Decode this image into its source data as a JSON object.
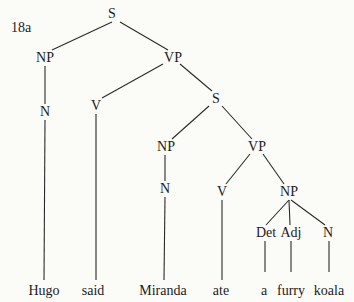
{
  "example_label": "18a",
  "tree": {
    "nodes": [
      {
        "id": "s1",
        "label": "S",
        "x": 112,
        "y": 14
      },
      {
        "id": "np1",
        "label": "NP",
        "x": 45,
        "y": 58
      },
      {
        "id": "vp1",
        "label": "VP",
        "x": 173,
        "y": 58
      },
      {
        "id": "n1",
        "label": "N",
        "x": 45,
        "y": 112
      },
      {
        "id": "v1",
        "label": "V",
        "x": 96,
        "y": 106
      },
      {
        "id": "s2",
        "label": "S",
        "x": 216,
        "y": 99
      },
      {
        "id": "np2",
        "label": "NP",
        "x": 166,
        "y": 147
      },
      {
        "id": "vp2",
        "label": "VP",
        "x": 257,
        "y": 147
      },
      {
        "id": "n2",
        "label": "N",
        "x": 165,
        "y": 189
      },
      {
        "id": "v2",
        "label": "V",
        "x": 222,
        "y": 192
      },
      {
        "id": "np3",
        "label": "NP",
        "x": 289,
        "y": 192
      },
      {
        "id": "det",
        "label": "Det",
        "x": 266,
        "y": 233
      },
      {
        "id": "adj",
        "label": "Adj",
        "x": 291,
        "y": 233
      },
      {
        "id": "n3",
        "label": "N",
        "x": 328,
        "y": 233
      }
    ],
    "leaves": [
      {
        "id": "w1",
        "label": "Hugo",
        "x": 44,
        "y": 291
      },
      {
        "id": "w2",
        "label": "said",
        "x": 93,
        "y": 291
      },
      {
        "id": "w3",
        "label": "Miranda",
        "x": 163,
        "y": 291
      },
      {
        "id": "w4",
        "label": "ate",
        "x": 221,
        "y": 291
      },
      {
        "id": "w5",
        "label": "a",
        "x": 264,
        "y": 291
      },
      {
        "id": "w6",
        "label": "furry",
        "x": 291,
        "y": 291
      },
      {
        "id": "w7",
        "label": "koala",
        "x": 329,
        "y": 291
      }
    ],
    "edges": [
      [
        112,
        22,
        52,
        50
      ],
      [
        120,
        22,
        168,
        50
      ],
      [
        45,
        66,
        45,
        104
      ],
      [
        163,
        64,
        102,
        98
      ],
      [
        180,
        64,
        212,
        91
      ],
      [
        45,
        120,
        44,
        280
      ],
      [
        96,
        114,
        96,
        280
      ],
      [
        209,
        106,
        172,
        139
      ],
      [
        222,
        106,
        252,
        139
      ],
      [
        165,
        155,
        165,
        181
      ],
      [
        165,
        197,
        164,
        280
      ],
      [
        250,
        154,
        226,
        184
      ],
      [
        263,
        154,
        284,
        184
      ],
      [
        222,
        200,
        222,
        280
      ],
      [
        289,
        200,
        266,
        225
      ],
      [
        289,
        200,
        290,
        225
      ],
      [
        291,
        200,
        325,
        225
      ],
      [
        265,
        241,
        265,
        272
      ],
      [
        291,
        241,
        291,
        272
      ],
      [
        329,
        241,
        329,
        272
      ]
    ]
  }
}
